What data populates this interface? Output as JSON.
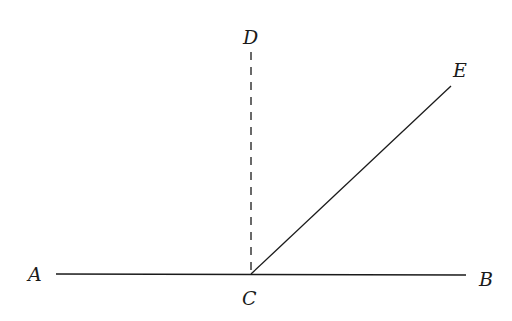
{
  "diagram": {
    "type": "geometry",
    "points": {
      "A": {
        "label": "A"
      },
      "B": {
        "label": "B"
      },
      "C": {
        "label": "C"
      },
      "D": {
        "label": "D"
      },
      "E": {
        "label": "E"
      }
    },
    "segments": [
      {
        "from": "A",
        "to": "B",
        "style": "solid"
      },
      {
        "from": "C",
        "to": "D",
        "style": "dashed"
      },
      {
        "from": "C",
        "to": "E",
        "style": "solid"
      }
    ],
    "colors": {
      "line": "#1a1a1a",
      "background": "#ffffff"
    }
  }
}
